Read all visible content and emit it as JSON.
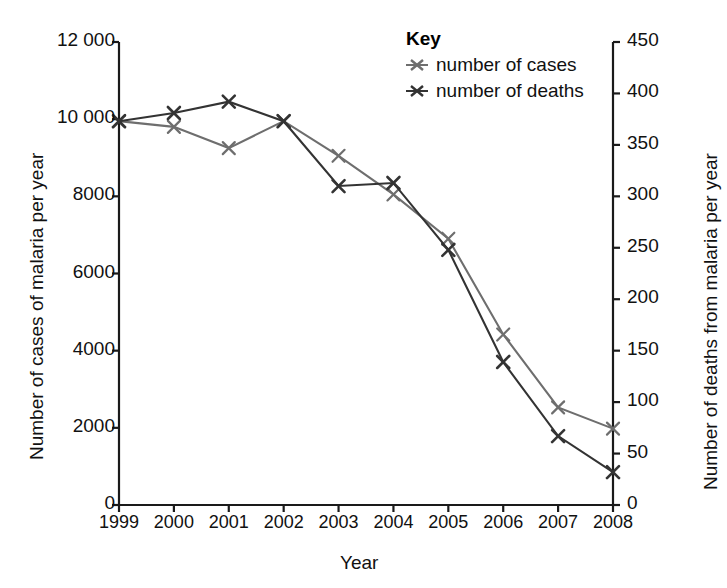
{
  "top_fragment": "",
  "legend": {
    "title": "Key",
    "items": [
      {
        "label": "number of cases",
        "color": "#6e6e6e",
        "marker": "asterisk-marker-icon"
      },
      {
        "label": "number of deaths",
        "color": "#333333",
        "marker": "asterisk-marker-icon"
      }
    ]
  },
  "axes": {
    "x_title": "Year",
    "y_left_title": "Number of cases of malaria per year",
    "y_right_title": "Number of deaths from malaria per year",
    "y_left_ticks": [
      "0",
      "2000",
      "4000",
      "6000",
      "8000",
      "10 000",
      "12 000"
    ],
    "y_right_ticks": [
      "0",
      "50",
      "100",
      "150",
      "200",
      "250",
      "300",
      "350",
      "400",
      "450"
    ],
    "x_ticks": [
      "1999",
      "2000",
      "2001",
      "2002",
      "2003",
      "2004",
      "2005",
      "2006",
      "2007",
      "2008"
    ]
  },
  "chart_data": {
    "type": "line",
    "title": "",
    "xlabel": "Year",
    "ylabel": "Number of cases of malaria per year",
    "y2label": "Number of deaths from malaria per year",
    "x": [
      1999,
      2000,
      2001,
      2002,
      2003,
      2004,
      2005,
      2006,
      2007,
      2008
    ],
    "xlim": [
      1999,
      2008
    ],
    "ylim": [
      0,
      12000
    ],
    "y2lim": [
      0,
      450
    ],
    "grid": false,
    "legend_position": "top-right",
    "series": [
      {
        "name": "number of cases",
        "axis": "left",
        "color": "#6e6e6e",
        "marker": "x",
        "values": [
          9950,
          9800,
          9250,
          9950,
          9050,
          8050,
          6900,
          4420,
          2530,
          1980
        ]
      },
      {
        "name": "number of deaths",
        "axis": "right",
        "color": "#333333",
        "marker": "x",
        "values": [
          373,
          381,
          392,
          373,
          310,
          313,
          248,
          139,
          67,
          32
        ]
      }
    ]
  }
}
